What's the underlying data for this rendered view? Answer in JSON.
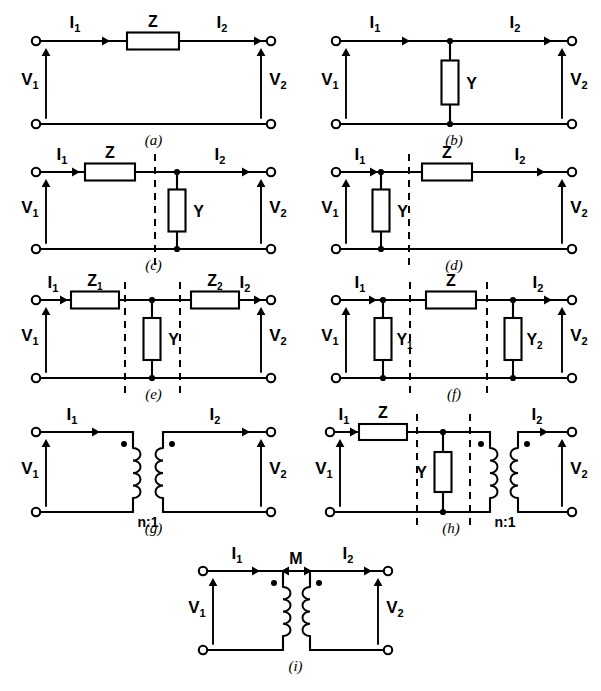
{
  "figure": {
    "type": "circuit-diagram",
    "background_color": "#ffffff",
    "ink_color": "#000000",
    "panel_count": 9
  },
  "common_labels": {
    "v1": "V",
    "v1_sub": "1",
    "v2": "V",
    "v2_sub": "2",
    "i1": "I",
    "i1_sub": "1",
    "i2": "I",
    "i2_sub": "2"
  },
  "panels": [
    {
      "id": "a",
      "caption": "(a)",
      "topology": "series-impedance",
      "x": 8,
      "y": 14,
      "w": 285,
      "h": 128,
      "left_x": 36,
      "right_x": 271,
      "top_y": 41,
      "bot_y": 124,
      "ports": {
        "input_voltage": "V1",
        "output_voltage": "V2",
        "input_current": "I1",
        "output_current": "I2"
      },
      "series": [
        {
          "label": "Z",
          "sub": "",
          "cx": 153,
          "w": 52,
          "h": 17
        }
      ],
      "shunt": [],
      "dashed": [],
      "arrows": [
        {
          "kind": "current",
          "label": "I",
          "sub": "1",
          "x1": 46,
          "x2": 110,
          "y": 41,
          "lx": 75,
          "ly": 28
        },
        {
          "kind": "current",
          "label": "I",
          "sub": "2",
          "x1": 196,
          "x2": 262,
          "y": 41,
          "lx": 222,
          "ly": 28
        }
      ],
      "transformer": null,
      "ratio_label": null,
      "mutual_label": null
    },
    {
      "id": "b",
      "caption": "(b)",
      "topology": "shunt-admittance",
      "x": 310,
      "y": 14,
      "w": 285,
      "h": 128,
      "left_x": 336,
      "right_x": 572,
      "top_y": 41,
      "bot_y": 124,
      "ports": {
        "input_voltage": "V1",
        "output_voltage": "V2",
        "input_current": "I1",
        "output_current": "I2"
      },
      "series": [],
      "shunt": [
        {
          "label": "Y",
          "sub": "",
          "x": 450,
          "w": 17,
          "h": 44,
          "label_side": "right"
        }
      ],
      "dashed": [],
      "arrows": [
        {
          "kind": "current",
          "label": "I",
          "sub": "1",
          "x1": 346,
          "x2": 410,
          "y": 41,
          "lx": 375,
          "ly": 28
        },
        {
          "kind": "current",
          "label": "I",
          "sub": "2",
          "x1": 487,
          "x2": 552,
          "y": 41,
          "lx": 515,
          "ly": 28
        }
      ],
      "transformer": null,
      "ratio_label": null,
      "mutual_label": null
    },
    {
      "id": "c",
      "caption": "(c)",
      "topology": "series-then-shunt",
      "x": 8,
      "y": 158,
      "w": 285,
      "h": 120,
      "left_x": 36,
      "right_x": 271,
      "top_y": 172,
      "bot_y": 249,
      "ports": {
        "input_voltage": "V1",
        "output_voltage": "V2",
        "input_current": "I1",
        "output_current": "I2"
      },
      "series": [
        {
          "label": "Z",
          "sub": "",
          "cx": 110,
          "w": 50,
          "h": 17
        }
      ],
      "shunt": [
        {
          "label": "Y",
          "sub": "",
          "x": 177,
          "w": 17,
          "h": 42,
          "label_side": "right"
        }
      ],
      "dashed": [
        {
          "x": 155
        }
      ],
      "arrows": [
        {
          "kind": "current",
          "label": "I",
          "sub": "1",
          "x1": 45,
          "x2": 80,
          "y": 172,
          "lx": 62,
          "ly": 160
        },
        {
          "kind": "current",
          "label": "I",
          "sub": "2",
          "x1": 196,
          "x2": 250,
          "y": 172,
          "lx": 220,
          "ly": 160
        }
      ],
      "transformer": null,
      "ratio_label": null,
      "mutual_label": null
    },
    {
      "id": "d",
      "caption": "(d)",
      "topology": "shunt-then-series",
      "x": 310,
      "y": 158,
      "w": 285,
      "h": 120,
      "left_x": 336,
      "right_x": 572,
      "top_y": 172,
      "bot_y": 249,
      "ports": {
        "input_voltage": "V1",
        "output_voltage": "V2",
        "input_current": "I1",
        "output_current": "I2"
      },
      "series": [
        {
          "label": "Z",
          "sub": "",
          "cx": 447,
          "w": 50,
          "h": 17
        }
      ],
      "shunt": [
        {
          "label": "Y",
          "sub": "",
          "x": 381,
          "w": 17,
          "h": 42,
          "label_side": "right"
        }
      ],
      "dashed": [
        {
          "x": 409
        }
      ],
      "arrows": [
        {
          "kind": "current",
          "label": "I",
          "sub": "1",
          "x1": 345,
          "x2": 378,
          "y": 172,
          "lx": 360,
          "ly": 160
        },
        {
          "kind": "current",
          "label": "I",
          "sub": "2",
          "x1": 497,
          "x2": 545,
          "y": 172,
          "lx": 520,
          "ly": 160
        }
      ],
      "transformer": null,
      "ratio_label": null,
      "mutual_label": null
    },
    {
      "id": "e",
      "caption": "(e)",
      "topology": "tee-network",
      "x": 8,
      "y": 285,
      "w": 285,
      "h": 122,
      "left_x": 36,
      "right_x": 271,
      "top_y": 300,
      "bot_y": 378,
      "ports": {
        "input_voltage": "V1",
        "output_voltage": "V2",
        "input_current": "I1",
        "output_current": "I2"
      },
      "series": [
        {
          "label": "Z",
          "sub": "1",
          "cx": 95,
          "w": 48,
          "h": 17
        },
        {
          "label": "Z",
          "sub": "2",
          "cx": 215,
          "w": 48,
          "h": 17
        }
      ],
      "shunt": [
        {
          "label": "Y",
          "sub": "",
          "x": 152,
          "w": 17,
          "h": 42,
          "label_side": "right"
        }
      ],
      "dashed": [
        {
          "x": 125
        },
        {
          "x": 180
        }
      ],
      "arrows": [
        {
          "kind": "current",
          "label": "I",
          "sub": "1",
          "x1": 45,
          "x2": 68,
          "y": 300,
          "lx": 53,
          "ly": 288
        },
        {
          "kind": "current",
          "label": "I",
          "sub": "2",
          "x1": 232,
          "x2": 262,
          "y": 300,
          "lx": 245,
          "ly": 288
        }
      ],
      "transformer": null,
      "ratio_label": null,
      "mutual_label": null
    },
    {
      "id": "f",
      "caption": "(f)",
      "topology": "pi-network",
      "x": 310,
      "y": 285,
      "w": 285,
      "h": 122,
      "left_x": 336,
      "right_x": 572,
      "top_y": 300,
      "bot_y": 378,
      "ports": {
        "input_voltage": "V1",
        "output_voltage": "V2",
        "input_current": "I1",
        "output_current": "I2"
      },
      "series": [
        {
          "label": "Z",
          "sub": "",
          "cx": 451,
          "w": 50,
          "h": 17
        }
      ],
      "shunt": [
        {
          "label": "Y",
          "sub": "1",
          "x": 383,
          "w": 17,
          "h": 42,
          "label_side": "right"
        },
        {
          "label": "Y",
          "sub": "2",
          "x": 513,
          "w": 17,
          "h": 42,
          "label_side": "right"
        }
      ],
      "dashed": [
        {
          "x": 410
        },
        {
          "x": 487
        }
      ],
      "arrows": [
        {
          "kind": "current",
          "label": "I",
          "sub": "1",
          "x1": 345,
          "x2": 377,
          "y": 300,
          "lx": 360,
          "ly": 288
        },
        {
          "kind": "current",
          "label": "I",
          "sub": "2",
          "x1": 521,
          "x2": 552,
          "y": 300,
          "lx": 538,
          "ly": 288
        }
      ],
      "transformer": null,
      "ratio_label": null,
      "mutual_label": null
    },
    {
      "id": "g",
      "caption": "(g)",
      "topology": "ideal-transformer",
      "x": 8,
      "y": 412,
      "w": 285,
      "h": 128,
      "left_x": 36,
      "right_x": 271,
      "top_y": 432,
      "bot_y": 512,
      "ports": {
        "input_voltage": "V1",
        "output_voltage": "V2",
        "input_current": "I1",
        "output_current": "I2"
      },
      "series": [],
      "shunt": [],
      "dashed": [],
      "arrows": [
        {
          "kind": "current",
          "label": "I",
          "sub": "1",
          "x1": 46,
          "x2": 100,
          "y": 432,
          "lx": 72,
          "ly": 420
        },
        {
          "kind": "current",
          "label": "I",
          "sub": "2",
          "x1": 192,
          "x2": 250,
          "y": 432,
          "lx": 215,
          "ly": 420
        }
      ],
      "transformer": {
        "primary_x": 133,
        "secondary_x": 163,
        "coil_top": 448,
        "coil_bot": 498,
        "turns": 4,
        "dot_primary": {
          "x": 124,
          "y": 444
        },
        "dot_secondary": {
          "x": 172,
          "y": 444
        }
      },
      "ratio_label": {
        "text": "n:1",
        "x": 148,
        "y": 527
      },
      "mutual_label": null
    },
    {
      "id": "h",
      "caption": "(h)",
      "topology": "series-shunt-transformer-cascade",
      "x": 310,
      "y": 412,
      "w": 285,
      "h": 128,
      "left_x": 330,
      "right_x": 572,
      "top_y": 432,
      "bot_y": 512,
      "ports": {
        "input_voltage": "V1",
        "output_voltage": "V2",
        "input_current": "I1",
        "output_current": "I2"
      },
      "series": [
        {
          "label": "Z",
          "sub": "",
          "cx": 383,
          "w": 48,
          "h": 16
        }
      ],
      "shunt": [
        {
          "label": "Y",
          "sub": "",
          "x": 443,
          "w": 17,
          "h": 40,
          "label_side": "left"
        }
      ],
      "dashed": [
        {
          "x": 417
        },
        {
          "x": 470
        }
      ],
      "arrows": [
        {
          "kind": "current",
          "label": "I",
          "sub": "1",
          "x1": 339,
          "x2": 358,
          "y": 432,
          "lx": 344,
          "ly": 420
        },
        {
          "kind": "current",
          "label": "I",
          "sub": "2",
          "x1": 520,
          "x2": 548,
          "y": 432,
          "lx": 537,
          "ly": 420
        }
      ],
      "transformer": {
        "primary_x": 490,
        "secondary_x": 518,
        "coil_top": 448,
        "coil_bot": 498,
        "turns": 4,
        "dot_primary": {
          "x": 481,
          "y": 444
        },
        "dot_secondary": {
          "x": 527,
          "y": 444
        }
      },
      "ratio_label": {
        "text": "n:1",
        "x": 505,
        "y": 527
      },
      "mutual_label": null
    },
    {
      "id": "i",
      "caption": "(i)",
      "topology": "mutually-coupled-coils",
      "x": 160,
      "y": 550,
      "w": 285,
      "h": 130,
      "left_x": 203,
      "right_x": 388,
      "top_y": 571,
      "bot_y": 650,
      "ports": {
        "input_voltage": "V1",
        "output_voltage": "V2",
        "input_current": "I1",
        "output_current": "I2"
      },
      "series": [],
      "shunt": [],
      "dashed": [],
      "arrows": [
        {
          "kind": "current",
          "label": "I",
          "sub": "1",
          "x1": 212,
          "x2": 260,
          "y": 571,
          "lx": 237,
          "ly": 559
        },
        {
          "kind": "current",
          "label": "I",
          "sub": "2",
          "x1": 325,
          "x2": 372,
          "y": 571,
          "lx": 348,
          "ly": 559
        }
      ],
      "transformer": {
        "primary_x": 283,
        "secondary_x": 310,
        "coil_top": 587,
        "coil_bot": 636,
        "turns": 4,
        "dot_primary": {
          "x": 274,
          "y": 583
        },
        "dot_secondary": {
          "x": 319,
          "y": 583
        }
      },
      "ratio_label": null,
      "mutual_label": {
        "text": "M",
        "x": 296,
        "y": 564,
        "arrow_y": 571,
        "arrow_x1": 281,
        "arrow_x2": 312
      }
    }
  ]
}
